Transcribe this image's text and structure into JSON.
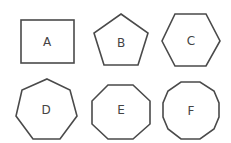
{
  "diagram": {
    "shapes": [
      {
        "label": "A",
        "type": "rectangle",
        "sides": 4
      },
      {
        "label": "B",
        "type": "pentagon",
        "sides": 5
      },
      {
        "label": "C",
        "type": "hexagon",
        "sides": 6
      },
      {
        "label": "D",
        "type": "heptagon",
        "sides": 7
      },
      {
        "label": "E",
        "type": "octagon",
        "sides": 8
      },
      {
        "label": "F",
        "type": "decagon",
        "sides": 10
      }
    ],
    "colors": {
      "stroke": "#4a4a4a",
      "text": "#444444",
      "background": "#ffffff"
    }
  }
}
